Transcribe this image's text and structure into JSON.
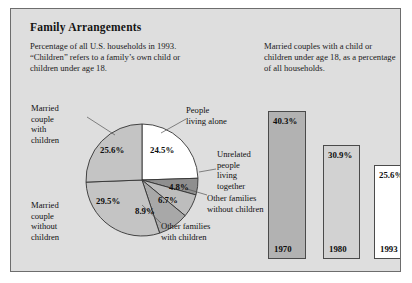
{
  "figure": {
    "title": "Family Arrangements",
    "caption_left": "Percentage of all U.S. households in 1993. “Children” refers to a family’s own child or children under age 18.",
    "caption_right": "Married couples with a child or children under age 18, as a percentage of all households.",
    "background_color": "#dedede",
    "border_color": "#6d6d6d"
  },
  "chart_data": [
    {
      "type": "pie",
      "title": "Percentage of all U.S. households in 1993",
      "categories": [
        "People living alone",
        "Unrelated people living together",
        "Other families without children",
        "Other families with children",
        "Married couple without children",
        "Married couple with children"
      ],
      "values": [
        24.5,
        4.8,
        6.7,
        8.9,
        29.5,
        25.6
      ],
      "labels": [
        "24.5%",
        "4.8%",
        "6.7%",
        "8.9%",
        "29.5%",
        "25.6%"
      ],
      "colors": [
        "#ffffff",
        "#8f8f8f",
        "#bdbdbd",
        "#a8a8a8",
        "#c4c4c4",
        "#c4c4c4"
      ],
      "start_angle_deg": 0,
      "direction": "clockwise",
      "legend": "none"
    },
    {
      "type": "bar",
      "title": "Married couples with a child or children under age 18, as a percentage of all households.",
      "categories": [
        "1970",
        "1980",
        "1993"
      ],
      "values": [
        40.3,
        30.9,
        25.6
      ],
      "labels": [
        "40.3%",
        "30.9%",
        "25.6%"
      ],
      "colors": [
        "#b2b2b2",
        "#d2d2d2",
        "#ffffff"
      ],
      "xlabel": "",
      "ylabel": "",
      "ylim": [
        0,
        45
      ],
      "grid": false,
      "legend": "none"
    }
  ],
  "pie_labels": {
    "married_with": "Married\ncouple\nwith\nchildren",
    "living_alone": "People\nliving alone",
    "unrelated": "Unrelated\npeople\nliving\ntogether",
    "other_without": "Other families\nwithout children",
    "other_with": "Other families\nwith children",
    "married_without": "Married\ncouple\nwithout\nchildren"
  }
}
